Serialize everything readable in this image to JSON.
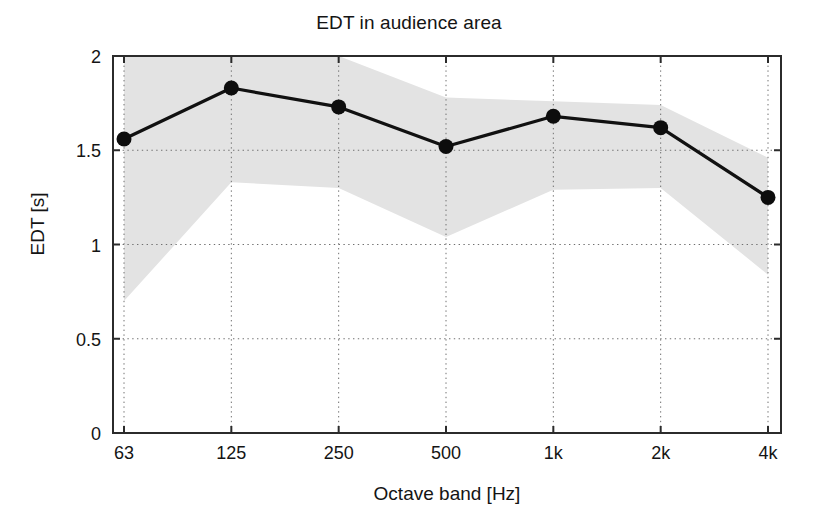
{
  "chart_data": {
    "type": "line",
    "title": "EDT in audience area",
    "xlabel": "Octave band [Hz]",
    "ylabel": "EDT [s]",
    "categories": [
      "63",
      "125",
      "250",
      "500",
      "1k",
      "2k",
      "4k"
    ],
    "values": [
      1.56,
      1.83,
      1.73,
      1.52,
      1.68,
      1.62,
      1.25
    ],
    "series": [
      {
        "name": "EDT mean",
        "values": [
          1.56,
          1.83,
          1.73,
          1.52,
          1.68,
          1.62,
          1.25
        ]
      },
      {
        "name": "range-upper",
        "values": [
          2.0,
          2.0,
          2.0,
          1.78,
          1.76,
          1.74,
          1.46
        ]
      },
      {
        "name": "range-lower",
        "values": [
          0.7,
          1.33,
          1.3,
          1.04,
          1.29,
          1.3,
          0.84
        ]
      }
    ],
    "ylim": [
      0,
      2
    ],
    "yticks": [
      0,
      0.5,
      1,
      1.5,
      2
    ],
    "ytick_labels": [
      "0",
      "0.5",
      "1",
      "1.5",
      "2"
    ],
    "xtick_labels": [
      "63",
      "125",
      "250",
      "500",
      "1k",
      "2k",
      "4k"
    ],
    "grid": true,
    "grid_style": "dotted",
    "legend": "none",
    "colors": {
      "line": "#111111",
      "marker": "#0d0d0d",
      "band": "#e2e2e2",
      "axis": "#2b2b2b",
      "grid": "#8c8c8c",
      "background": "#ffffff"
    }
  },
  "figure": {
    "title": "EDT in audience area",
    "x_axis_label": "Octave band [Hz]",
    "y_axis_label": "EDT [s]"
  }
}
